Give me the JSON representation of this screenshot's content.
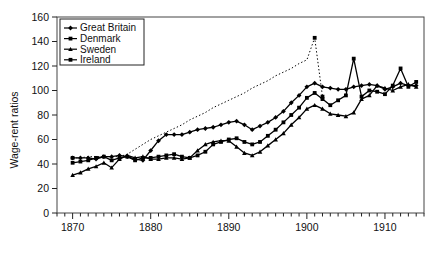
{
  "chart_data": {
    "type": "line",
    "title": "",
    "xlabel": "",
    "ylabel": "Wage-rent ratios",
    "xlim": [
      1868,
      1915
    ],
    "ylim": [
      0,
      160
    ],
    "ytick_labels": [
      "0",
      "20",
      "40",
      "60",
      "80",
      "100",
      "120",
      "140",
      "160"
    ],
    "yticks": [
      0,
      20,
      40,
      60,
      80,
      100,
      120,
      140,
      160
    ],
    "xtick_labels": [
      "1870",
      "1880",
      "1890",
      "1900",
      "1910"
    ],
    "xticks": [
      1870,
      1880,
      1890,
      1900,
      1910
    ],
    "minor_tick_step": 1,
    "grid": false,
    "legend_position": "top-left",
    "series": [
      {
        "name": "Great Britain",
        "style": "solid",
        "marker": "diamond",
        "color": "#000000",
        "x": [
          1870,
          1871,
          1872,
          1873,
          1874,
          1875,
          1876,
          1877,
          1878,
          1879,
          1880,
          1881,
          1882,
          1883,
          1884,
          1885,
          1886,
          1887,
          1888,
          1889,
          1890,
          1891,
          1892,
          1893,
          1894,
          1895,
          1896,
          1897,
          1898,
          1899,
          1900,
          1901,
          1902,
          1903,
          1904,
          1905,
          1906,
          1907,
          1908,
          1909,
          1910,
          1911,
          1912,
          1913,
          1914
        ],
        "values": [
          45,
          45,
          45,
          44,
          46,
          46,
          47,
          46,
          44,
          43,
          51,
          59,
          64,
          64,
          64,
          66,
          68,
          69,
          70,
          72,
          74,
          75,
          72,
          68,
          71,
          74,
          78,
          83,
          90,
          96,
          103,
          106,
          103,
          102,
          101,
          101,
          103,
          104,
          105,
          104,
          101,
          103,
          106,
          104,
          104
        ]
      },
      {
        "name": "Denmark",
        "style": "solid",
        "marker": "square",
        "color": "#000000",
        "x": [
          1870,
          1871,
          1872,
          1873,
          1874,
          1875,
          1876,
          1877,
          1878,
          1879,
          1880,
          1881,
          1882,
          1883,
          1884,
          1885,
          1886,
          1887,
          1888,
          1889,
          1890,
          1891,
          1892,
          1893,
          1894,
          1895,
          1896,
          1897,
          1898,
          1899,
          1900,
          1901,
          1902,
          1903,
          1904,
          1905,
          1906,
          1907,
          1908,
          1909,
          1910,
          1911,
          1912,
          1913,
          1914
        ],
        "values": [
          41,
          42,
          43,
          45,
          46,
          43,
          45,
          46,
          43,
          45,
          45,
          46,
          47,
          48,
          46,
          45,
          47,
          50,
          56,
          58,
          60,
          61,
          58,
          56,
          58,
          63,
          68,
          74,
          80,
          86,
          94,
          98,
          93,
          88,
          92,
          96,
          126,
          95,
          100,
          99,
          97,
          104,
          118,
          103,
          107
        ]
      },
      {
        "name": "Sweden",
        "style": "solid",
        "marker": "triangle",
        "color": "#000000",
        "x": [
          1870,
          1871,
          1872,
          1873,
          1874,
          1875,
          1876,
          1877,
          1878,
          1879,
          1880,
          1881,
          1882,
          1883,
          1884,
          1885,
          1886,
          1887,
          1888,
          1889,
          1890,
          1891,
          1892,
          1893,
          1894,
          1895,
          1896,
          1897,
          1898,
          1899,
          1900,
          1901,
          1902,
          1903,
          1904,
          1905,
          1906,
          1907,
          1908,
          1909,
          1910,
          1911,
          1912,
          1913,
          1914
        ],
        "values": [
          31,
          33,
          36,
          38,
          41,
          37,
          44,
          47,
          45,
          46,
          44,
          44,
          45,
          45,
          44,
          45,
          51,
          56,
          58,
          59,
          59,
          54,
          49,
          47,
          50,
          55,
          60,
          65,
          72,
          78,
          85,
          88,
          85,
          81,
          80,
          79,
          82,
          93,
          96,
          104,
          102,
          100,
          103,
          105,
          103
        ]
      },
      {
        "name": "Ireland",
        "style": "dotted",
        "marker": "dot",
        "color": "#000000",
        "x": [
          1870,
          1871,
          1872,
          1873,
          1874,
          1875,
          1876,
          1877,
          1878,
          1879,
          1880,
          1881,
          1882,
          1883,
          1884,
          1885,
          1886,
          1887,
          1888,
          1889,
          1890,
          1891,
          1892,
          1893,
          1894,
          1895,
          1896,
          1897,
          1898,
          1899,
          1900,
          1901,
          1902
        ],
        "values": [
          45,
          45,
          46,
          46,
          46,
          46,
          46,
          48,
          52,
          56,
          60,
          63,
          66,
          69,
          72,
          76,
          79,
          82,
          86,
          89,
          92,
          95,
          98,
          102,
          105,
          108,
          112,
          115,
          118,
          122,
          125,
          143,
          95
        ]
      }
    ],
    "annotations": [
      {
        "text": "Ireland spike",
        "x": 1901,
        "y": 143
      },
      {
        "text": "Denmark spike",
        "x": 1906,
        "y": 126
      },
      {
        "text": "Denmark spike 2",
        "x": 1912,
        "y": 118
      }
    ]
  },
  "legend": {
    "entries": [
      {
        "label": "Great Britain"
      },
      {
        "label": "Denmark"
      },
      {
        "label": "Sweden"
      },
      {
        "label": "Ireland"
      }
    ]
  }
}
